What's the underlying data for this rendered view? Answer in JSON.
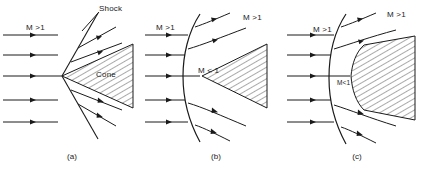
{
  "figure": {
    "type": "diagram",
    "panel_count": 3,
    "stroke_color": "#1a1a1a",
    "hatch_color": "#2b2b2b",
    "background": "#ffffff"
  },
  "panels": [
    {
      "id": "a",
      "caption": "(a)",
      "shock_type": "attached-oblique-shock",
      "body": "sharp-cone",
      "labels": {
        "freestream": "M >1",
        "shock": "Shock",
        "body": "Cone"
      },
      "streamline_count": 5,
      "post_shock_streamline_count": 4
    },
    {
      "id": "b",
      "caption": "(b)",
      "shock_type": "detached-bow-shock",
      "body": "blunt-nosed-cone",
      "labels": {
        "freestream": "M >1",
        "post_shock": "M >1",
        "subsonic": "M < 1"
      },
      "streamline_count": 5,
      "post_shock_streamline_count": 4
    },
    {
      "id": "c",
      "caption": "(c)",
      "shock_type": "detached-bow-shock",
      "body": "blunt-body",
      "labels": {
        "freestream": "M >1",
        "post_shock": "M >1",
        "subsonic": "M<1"
      },
      "streamline_count": 5,
      "post_shock_streamline_count": 4
    }
  ]
}
